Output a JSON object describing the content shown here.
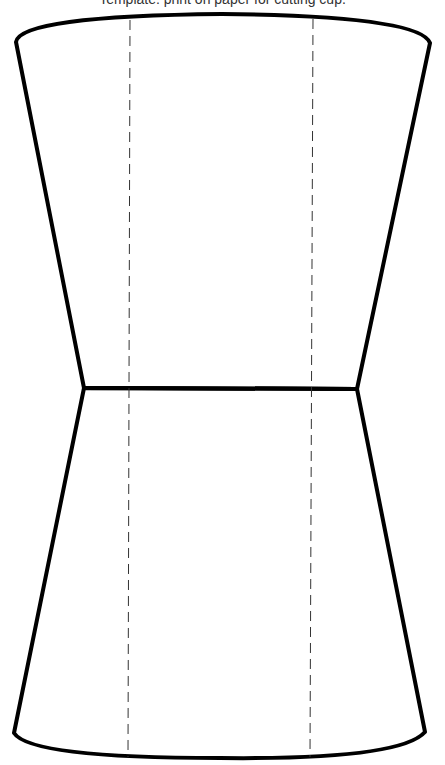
{
  "caption": {
    "text": "Template: print on paper for cutting cup."
  },
  "diagram": {
    "type": "cup-template",
    "colors": {
      "outline": "#000000",
      "fold_line": "#333333",
      "background": "#ffffff"
    },
    "upper_panel": {
      "top_left": [
        15,
        42
      ],
      "top_right": [
        430,
        43
      ],
      "top_arc_peak_y": 14,
      "waist_left": [
        84,
        388
      ],
      "waist_right": [
        357,
        389
      ]
    },
    "lower_panel": {
      "waist_left": [
        84,
        388
      ],
      "waist_right": [
        357,
        389
      ],
      "bottom_left": [
        14,
        733
      ],
      "bottom_right": [
        425,
        734
      ],
      "bottom_arc_low_y": 758
    },
    "fold_lines": [
      {
        "name": "left",
        "x_top": 130,
        "x_bottom": 128
      },
      {
        "name": "right",
        "x_top": 313,
        "x_bottom": 310
      }
    ]
  }
}
